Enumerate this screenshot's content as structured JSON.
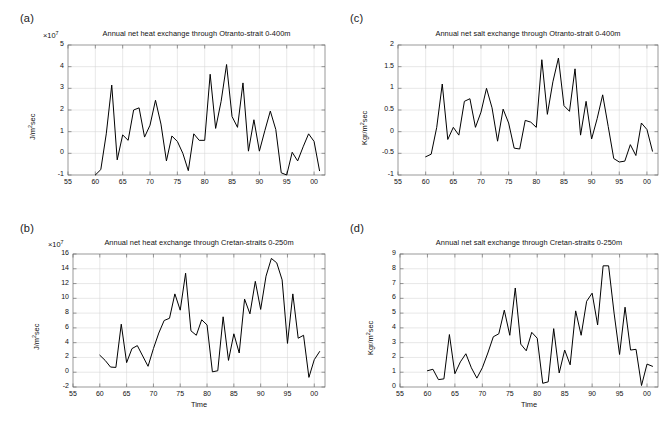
{
  "figure": {
    "background": "#ffffff",
    "line_color": "#000000",
    "grid_color": "#d4d4d4",
    "axis_color": "#6e6e6e"
  },
  "panels": [
    {
      "key": "a",
      "label": "(a)",
      "title": "Annual net heat exchange through Otranto-strait 0-400m",
      "ylabel": "J/m",
      "ylabel_sup": "2",
      "ylabel_tail": "sec",
      "exp_prefix": "×10",
      "exp_sup": "7",
      "xlabel": "",
      "xticks": [
        "55",
        "60",
        "65",
        "70",
        "75",
        "80",
        "85",
        "90",
        "95",
        "00"
      ],
      "yticks": [
        "5",
        "4",
        "3",
        "2",
        "1",
        "0",
        "-1"
      ]
    },
    {
      "key": "c",
      "label": "(c)",
      "title": "Annual net salt exchange through Otranto-strait 0-400m",
      "ylabel": "Kgr/m",
      "ylabel_sup": "2",
      "ylabel_tail": "sec",
      "exp_prefix": "",
      "exp_sup": "",
      "xlabel": "",
      "xticks": [
        "55",
        "60",
        "65",
        "70",
        "75",
        "80",
        "85",
        "90",
        "95",
        "00"
      ],
      "yticks": [
        "2",
        "1.5",
        "1",
        "0.5",
        "0",
        "-0.5",
        "-1"
      ]
    },
    {
      "key": "b",
      "label": "(b)",
      "title": "Annual net heat exchange through Cretan-straits 0-250m",
      "ylabel": "J/m",
      "ylabel_sup": "2",
      "ylabel_tail": "sec",
      "exp_prefix": "×10",
      "exp_sup": "7",
      "xlabel": "Time",
      "xticks": [
        "55",
        "60",
        "65",
        "70",
        "75",
        "80",
        "85",
        "90",
        "95",
        "00"
      ],
      "yticks": [
        "16",
        "14",
        "12",
        "10",
        "8",
        "6",
        "4",
        "2",
        "0",
        "-2"
      ]
    },
    {
      "key": "d",
      "label": "(d)",
      "title": "Annual net salt exchange through Cretan-straits 0-250m",
      "ylabel": "Kgr/m",
      "ylabel_sup": "2",
      "ylabel_tail": "sec",
      "exp_prefix": "",
      "exp_sup": "",
      "xlabel": "Time",
      "xticks": [
        "55",
        "60",
        "65",
        "70",
        "75",
        "80",
        "85",
        "90",
        "95",
        "00"
      ],
      "yticks": [
        "9",
        "8",
        "7",
        "6",
        "5",
        "4",
        "3",
        "2",
        "1",
        "0"
      ]
    }
  ],
  "chart_data": [
    {
      "id": "a",
      "type": "line",
      "title": "Annual net heat exchange through Otranto-strait 0-400m",
      "xlabel": "",
      "ylabel": "J/m2sec",
      "y_scale_exponent": 7,
      "xlim": [
        55,
        102
      ],
      "ylim": [
        -1,
        5
      ],
      "grid": true,
      "legend": "none",
      "x": [
        60,
        61,
        62,
        63,
        64,
        65,
        66,
        67,
        68,
        69,
        70,
        71,
        72,
        73,
        74,
        75,
        76,
        77,
        78,
        79,
        80,
        81,
        82,
        83,
        84,
        85,
        86,
        87,
        88,
        89,
        90,
        91,
        92,
        93,
        94,
        95,
        96,
        97,
        98,
        99,
        100,
        101
      ],
      "values": [
        -1.0,
        -0.75,
        0.9,
        3.15,
        -0.3,
        0.85,
        0.6,
        2.0,
        2.1,
        0.75,
        1.3,
        2.45,
        1.35,
        -0.35,
        0.8,
        0.55,
        0.0,
        -0.8,
        0.9,
        0.6,
        0.6,
        3.65,
        1.15,
        2.4,
        4.1,
        1.7,
        1.2,
        3.25,
        0.1,
        1.55,
        0.1,
        1.05,
        1.95,
        1.1,
        -0.9,
        -1.0,
        0.05,
        -0.35,
        0.3,
        0.9,
        0.55,
        -0.8
      ]
    },
    {
      "id": "c",
      "type": "line",
      "title": "Annual net salt exchange through Otranto-strait 0-400m",
      "xlabel": "",
      "ylabel": "Kgr/m2sec",
      "xlim": [
        55,
        102
      ],
      "ylim": [
        -1,
        2
      ],
      "grid": true,
      "legend": "none",
      "x": [
        60,
        61,
        62,
        63,
        64,
        65,
        66,
        67,
        68,
        69,
        70,
        71,
        72,
        73,
        74,
        75,
        76,
        77,
        78,
        79,
        80,
        81,
        82,
        83,
        84,
        85,
        86,
        87,
        88,
        89,
        90,
        91,
        92,
        93,
        94,
        95,
        96,
        97,
        98,
        99,
        100,
        101
      ],
      "values": [
        -0.58,
        -0.52,
        0.1,
        1.1,
        -0.18,
        0.1,
        -0.08,
        0.7,
        0.76,
        0.1,
        0.45,
        1.0,
        0.55,
        -0.22,
        0.52,
        0.2,
        -0.38,
        -0.4,
        0.26,
        0.22,
        0.1,
        1.66,
        0.4,
        1.15,
        1.7,
        0.6,
        0.47,
        1.45,
        -0.08,
        0.7,
        -0.17,
        0.3,
        0.85,
        0.12,
        -0.62,
        -0.7,
        -0.68,
        -0.3,
        -0.55,
        0.2,
        0.05,
        -0.45
      ]
    },
    {
      "id": "b",
      "type": "line",
      "title": "Annual net heat exchange through Cretan-straits 0-250m",
      "xlabel": "Time",
      "ylabel": "J/m2sec",
      "y_scale_exponent": 7,
      "xlim": [
        55,
        102
      ],
      "ylim": [
        -2,
        16
      ],
      "grid": true,
      "legend": "none",
      "x": [
        60,
        61,
        62,
        63,
        64,
        65,
        66,
        67,
        68,
        69,
        70,
        71,
        72,
        73,
        74,
        75,
        76,
        77,
        78,
        79,
        80,
        81,
        82,
        83,
        84,
        85,
        86,
        87,
        88,
        89,
        90,
        91,
        92,
        93,
        94,
        95,
        96,
        97,
        98,
        99,
        100,
        101
      ],
      "values": [
        2.3,
        1.6,
        0.7,
        0.65,
        6.5,
        1.3,
        3.2,
        3.6,
        2.2,
        0.8,
        3.2,
        5.3,
        7.0,
        7.3,
        10.6,
        8.4,
        13.4,
        5.6,
        5.0,
        7.1,
        6.4,
        0.05,
        0.2,
        7.5,
        1.6,
        5.2,
        2.6,
        9.9,
        7.9,
        12.3,
        8.5,
        13.0,
        15.4,
        14.8,
        12.5,
        3.9,
        10.6,
        4.6,
        5.0,
        -0.7,
        1.7,
        2.8
      ]
    },
    {
      "id": "d",
      "type": "line",
      "title": "Annual net salt exchange through Cretan-straits 0-250m",
      "xlabel": "Time",
      "ylabel": "Kgr/m2sec",
      "xlim": [
        55,
        102
      ],
      "ylim": [
        0,
        9
      ],
      "grid": true,
      "legend": "none",
      "x": [
        60,
        61,
        62,
        63,
        64,
        65,
        66,
        67,
        68,
        69,
        70,
        71,
        72,
        73,
        74,
        75,
        76,
        77,
        78,
        79,
        80,
        81,
        82,
        83,
        84,
        85,
        86,
        87,
        88,
        89,
        90,
        91,
        92,
        93,
        94,
        95,
        96,
        97,
        98,
        99,
        100,
        101
      ],
      "values": [
        1.1,
        1.2,
        0.5,
        0.55,
        3.55,
        0.9,
        1.7,
        2.25,
        1.3,
        0.6,
        1.3,
        2.3,
        3.4,
        3.6,
        5.2,
        3.5,
        6.7,
        2.9,
        2.45,
        3.7,
        3.3,
        0.25,
        0.35,
        3.95,
        0.95,
        2.5,
        1.5,
        5.15,
        3.5,
        5.8,
        6.35,
        4.2,
        8.2,
        8.2,
        5.0,
        2.2,
        5.4,
        2.5,
        2.55,
        0.1,
        1.55,
        1.4
      ]
    }
  ]
}
